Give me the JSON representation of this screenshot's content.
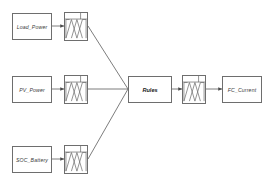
{
  "diagram": {
    "background_color": "#ffffff",
    "line_color": "#6e6e6e",
    "text_color": "#3c3c3c",
    "inputs": [
      {
        "id": "load_power",
        "label": "Load_Power"
      },
      {
        "id": "pv_power",
        "label": "PV_Power"
      },
      {
        "id": "soc_battery",
        "label": "SOC_Battery"
      }
    ],
    "fuzzifiers": [
      {
        "id": "mf_load_power",
        "label": "membership-functions"
      },
      {
        "id": "mf_pv_power",
        "label": "membership-functions"
      },
      {
        "id": "mf_soc_battery",
        "label": "membership-functions"
      }
    ],
    "inference": {
      "id": "rules",
      "label": "Rules"
    },
    "defuzzifier": {
      "id": "mf_output",
      "label": "membership-functions"
    },
    "outputs": [
      {
        "id": "fc_current",
        "label": "FC_Current"
      }
    ]
  }
}
